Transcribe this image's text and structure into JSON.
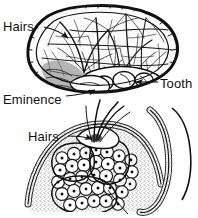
{
  "figure": {
    "background_color": "#ffffff",
    "ink_color": "#111111",
    "stipple_color": "#4a4a4a",
    "panels": [
      {
        "id": "upper-panel",
        "name": "oval-surface-view",
        "description": "Oval outlined body filled with a dense branching network of fibres, with rounded tooth structures at lower right and an eminence at lower centre"
      },
      {
        "id": "lower-panel",
        "name": "cross-section-view",
        "description": "Cross section of a mound of tissue with stippled epithelial surface, projecting hair shafts and clustered glandular acini beneath"
      }
    ],
    "labels": [
      {
        "id": "hairs-top",
        "text": "Hairs",
        "panel": "upper-panel",
        "leader": "line-with-arrow",
        "position": "top-left"
      },
      {
        "id": "eminence",
        "text": "Eminence",
        "panel": "upper-panel",
        "leader": "line-with-arrow",
        "position": "lower-left"
      },
      {
        "id": "tooth",
        "text": "Tooth",
        "panel": "upper-panel",
        "leader": "line-with-arrow",
        "position": "right"
      },
      {
        "id": "hairs-bottom",
        "text": "Hairs",
        "panel": "lower-panel",
        "leader": "line-with-arrow",
        "position": "left"
      }
    ],
    "icons": {
      "leader_line": "leader-line-icon",
      "arrowhead": "arrowhead-icon"
    }
  }
}
